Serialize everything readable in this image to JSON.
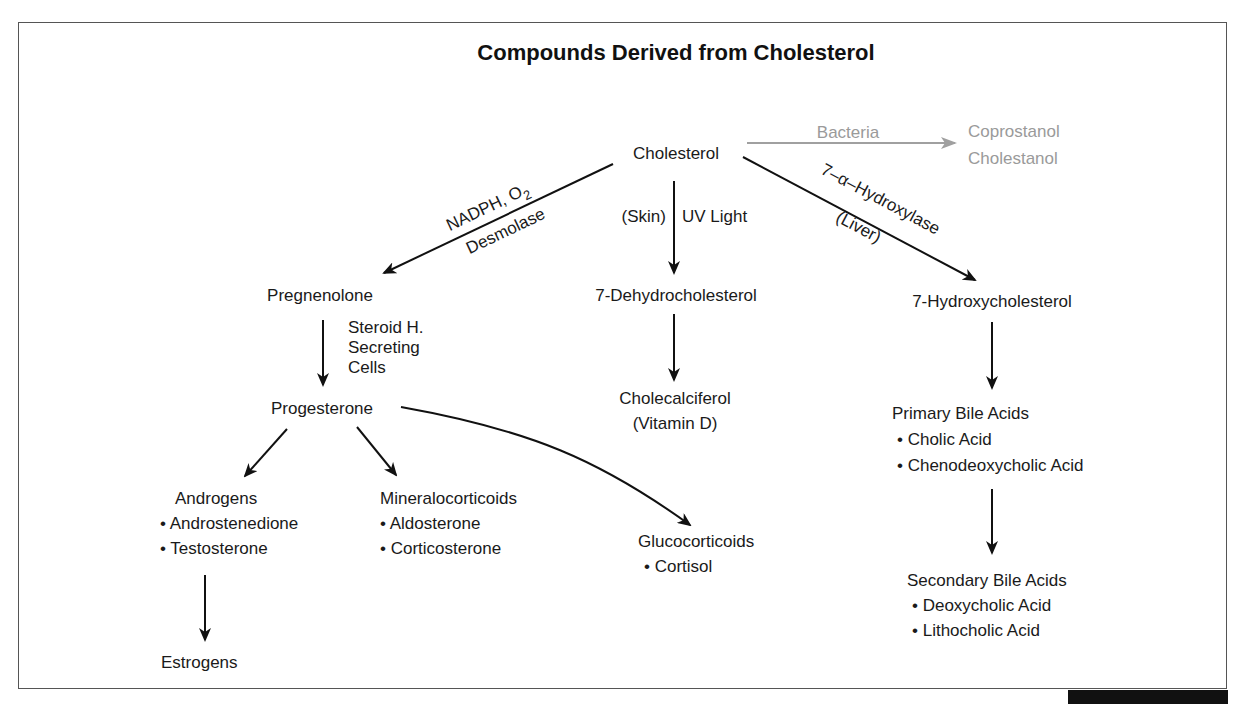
{
  "title": "Compounds Derived from Cholesterol",
  "colors": {
    "text": "#1a1a1a",
    "faded": "#9a9a9a",
    "frame": "#555555"
  },
  "nodes": {
    "cholesterol": "Cholesterol",
    "coprostanol": "Coprostanol",
    "cholestanol": "Cholestanol",
    "pregnenolone": "Pregnenolone",
    "dehydrocholesterol": "7-Dehydrocholesterol",
    "hydroxycholesterol": "7-Hydroxycholesterol",
    "progesterone": "Progesterone",
    "cholecalciferol": "Cholecalciferol",
    "vitamin_d": "(Vitamin D)",
    "androgens": {
      "title": "Androgens",
      "items": [
        "• Androstenedione",
        "• Testosterone"
      ]
    },
    "mineralocorticoids": {
      "title": "Mineralocorticoids",
      "items": [
        "• Aldosterone",
        "• Corticosterone"
      ]
    },
    "glucocorticoids": {
      "title": "Glucocorticoids",
      "items": [
        "• Cortisol"
      ]
    },
    "estrogens": "Estrogens",
    "primary_bile_acids": {
      "title": "Primary Bile Acids",
      "items": [
        "• Cholic Acid",
        "• Chenodeoxycholic Acid"
      ]
    },
    "secondary_bile_acids": {
      "title": "Secondary Bile Acids",
      "items": [
        "• Deoxycholic Acid",
        "• Lithocholic Acid"
      ]
    }
  },
  "edge_labels": {
    "bacteria": "Bacteria",
    "nadph": "NADPH, O",
    "nadph_sub": "2",
    "desmolase": "Desmolase",
    "skin": "(Skin)",
    "uv_light": "UV Light",
    "hydroxylase": "7–α–Hydroxylase",
    "liver": "(Liver)",
    "steroid_1": "Steroid H.",
    "steroid_2": "Secreting",
    "steroid_3": "Cells"
  }
}
